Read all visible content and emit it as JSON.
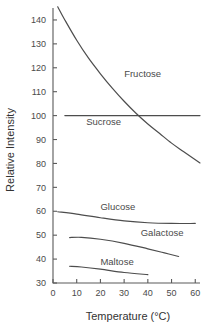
{
  "chart_data": {
    "type": "line",
    "title": "",
    "xlabel": "Temperature (°C)",
    "ylabel": "Relative Intensity",
    "xlim": [
      0,
      62
    ],
    "ylim": [
      30,
      145
    ],
    "xticks": [
      0,
      10,
      20,
      30,
      40,
      50,
      60
    ],
    "xticklabels": [
      "0",
      "10",
      "20",
      "30",
      "40",
      "50",
      "60"
    ],
    "yticks": [
      30,
      40,
      50,
      60,
      70,
      80,
      90,
      100,
      110,
      120,
      130,
      140
    ],
    "yticklabels": [
      "30",
      "40",
      "50",
      "60",
      "70",
      "80",
      "90",
      "100",
      "110",
      "120",
      "130",
      "140"
    ],
    "grid": false,
    "legend_position": "inline-labels",
    "line_color": "#4d4d4d",
    "series": [
      {
        "name": "Fructose",
        "label": "Fructose",
        "label_x": 30,
        "label_y": 116,
        "x": [
          2,
          5,
          10,
          15,
          20,
          25,
          30,
          35,
          40,
          45,
          50,
          55,
          62
        ],
        "values": [
          145.5,
          140.0,
          131.5,
          124.0,
          117.5,
          111.5,
          106.0,
          101.0,
          96.5,
          92.5,
          88.5,
          85.0,
          80.2
        ]
      },
      {
        "name": "Sucrose",
        "label": "Sucrose",
        "label_x": 14,
        "label_y": 96,
        "x": [
          5,
          62
        ],
        "values": [
          100.0,
          100.0
        ]
      },
      {
        "name": "Glucose",
        "label": "Glucose",
        "label_x": 20,
        "label_y": 60.5,
        "x": [
          2,
          10,
          20,
          30,
          40,
          50,
          60
        ],
        "values": [
          59.8,
          58.8,
          57.3,
          56.0,
          55.2,
          54.9,
          54.9
        ]
      },
      {
        "name": "Galactose",
        "label": "Galactose",
        "label_x": 37,
        "label_y": 49.5,
        "x": [
          7,
          12,
          20,
          30,
          40,
          47,
          53
        ],
        "values": [
          49.0,
          49.1,
          48.3,
          46.6,
          44.3,
          42.6,
          41.1
        ]
      },
      {
        "name": "Maltose",
        "label": "Maltose",
        "label_x": 20,
        "label_y": 37.5,
        "x": [
          7,
          12,
          20,
          30,
          40
        ],
        "values": [
          37.0,
          36.7,
          35.8,
          34.4,
          33.5
        ]
      }
    ]
  }
}
